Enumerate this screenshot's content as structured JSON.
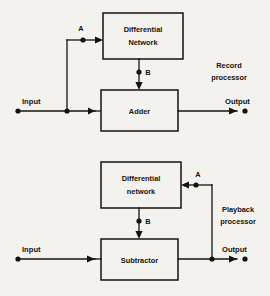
{
  "diagram": {
    "background_color": "#f4f2ee",
    "line_color": "#16130f",
    "sections": [
      {
        "id": "record",
        "side_label_line1": "Record",
        "side_label_line2": "processor",
        "input_label": "Input",
        "output_label": "Output",
        "tap_a_label": "A",
        "tap_b_label": "B",
        "blocks": [
          {
            "id": "differential-network",
            "line1": "Differential",
            "line2": "Network"
          },
          {
            "id": "adder",
            "line1": "Adder",
            "line2": ""
          }
        ]
      },
      {
        "id": "playback",
        "side_label_line1": "Playback",
        "side_label_line2": "processor",
        "input_label": "Input",
        "output_label": "Output",
        "tap_a_label": "A",
        "tap_b_label": "B",
        "blocks": [
          {
            "id": "differential-network",
            "line1": "Differential",
            "line2": "network"
          },
          {
            "id": "subtractor",
            "line1": "Subtractor",
            "line2": ""
          }
        ]
      }
    ]
  }
}
